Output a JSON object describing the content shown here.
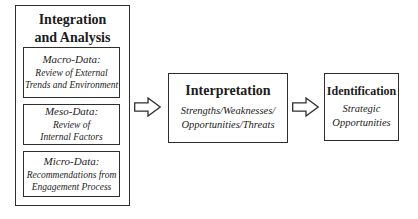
{
  "integration_box": {
    "title": "Integration\nand Analysis",
    "sub_boxes": [
      {
        "heading": "Macro-Data:",
        "body": "Review of External\nTrends and Environment"
      },
      {
        "heading": "Meso-Data:",
        "body": "Review of\nInternal Factors"
      },
      {
        "heading": "Micro-Data:",
        "body": "Recommendations from\nEngagement Process"
      }
    ]
  },
  "interpretation_box": {
    "title": "Interpretation",
    "body": "Strengths/Weaknesses/\nOpportunities/Threats"
  },
  "identification_box": {
    "title": "Identification",
    "body": "Strategic\nOpportunities"
  },
  "colors": {
    "background": "#ffffff",
    "border": "#2e2e2e",
    "text": "#1c1c1c",
    "arrow_fill": "#ffffff"
  }
}
